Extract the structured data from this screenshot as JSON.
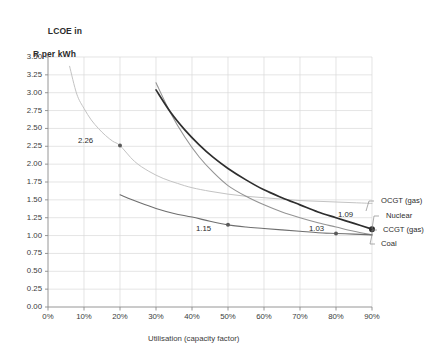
{
  "chart_data": {
    "type": "line",
    "title": "LCOE in R per kWh",
    "title_line1": "LCOE in",
    "title_line2": "R per kWh",
    "xlabel": "Utilisation (capacity factor)",
    "ylabel": "LCOE in R per kWh",
    "xlim": [
      0,
      90
    ],
    "ylim": [
      0,
      3.5
    ],
    "grid": true,
    "legend_position": "right-inline",
    "x_ticks": [
      "0%",
      "10%",
      "20%",
      "30%",
      "40%",
      "50%",
      "60%",
      "70%",
      "80%",
      "90%"
    ],
    "x_tick_values": [
      0,
      10,
      20,
      30,
      40,
      50,
      60,
      70,
      80,
      90
    ],
    "y_ticks": [
      "0.00",
      "0.25",
      "0.50",
      "0.75",
      "1.00",
      "1.25",
      "1.50",
      "1.75",
      "2.00",
      "2.25",
      "2.50",
      "2.75",
      "3.00",
      "3.25",
      "3.50"
    ],
    "y_tick_values": [
      0.0,
      0.25,
      0.5,
      0.75,
      1.0,
      1.25,
      1.5,
      1.75,
      2.0,
      2.25,
      2.5,
      2.75,
      3.0,
      3.25,
      3.5
    ],
    "series": [
      {
        "name": "OCGT (gas)",
        "color": "#c3c3c3",
        "x": [
          6,
          8,
          10,
          12,
          14,
          16,
          18,
          20,
          24,
          28,
          32,
          36,
          40,
          45,
          50,
          55,
          60,
          65,
          70,
          75,
          80,
          85,
          90
        ],
        "values": [
          3.37,
          2.98,
          2.78,
          2.62,
          2.5,
          2.4,
          2.32,
          2.26,
          2.04,
          1.9,
          1.8,
          1.73,
          1.67,
          1.62,
          1.58,
          1.55,
          1.53,
          1.51,
          1.49,
          1.48,
          1.47,
          1.46,
          1.45
        ]
      },
      {
        "name": "CCGT (gas)",
        "color": "#949494",
        "x": [
          30,
          34,
          38,
          42,
          46,
          50,
          55,
          60,
          65,
          70,
          75,
          80,
          85,
          90
        ],
        "values": [
          3.14,
          2.72,
          2.38,
          2.1,
          1.88,
          1.7,
          1.55,
          1.43,
          1.33,
          1.25,
          1.18,
          1.12,
          1.06,
          1.01
        ]
      },
      {
        "name": "Nuclear",
        "color": "#2e2e2e",
        "x": [
          30,
          34,
          38,
          42,
          46,
          50,
          55,
          60,
          65,
          70,
          75,
          80,
          85,
          90
        ],
        "values": [
          3.04,
          2.73,
          2.48,
          2.27,
          2.09,
          1.94,
          1.78,
          1.64,
          1.53,
          1.43,
          1.33,
          1.25,
          1.17,
          1.09
        ]
      },
      {
        "name": "Coal",
        "color": "#6e6e6e",
        "x": [
          20,
          25,
          30,
          35,
          40,
          45,
          50,
          55,
          60,
          65,
          70,
          75,
          80,
          85,
          90
        ],
        "values": [
          1.57,
          1.47,
          1.38,
          1.31,
          1.26,
          1.2,
          1.15,
          1.12,
          1.1,
          1.08,
          1.06,
          1.04,
          1.03,
          1.02,
          1.01
        ]
      }
    ],
    "annotations": [
      {
        "label": "2.26",
        "x": 20,
        "y": 2.26,
        "series": "OCGT (gas)"
      },
      {
        "label": "1.15",
        "x": 50,
        "y": 1.15,
        "series": "Coal"
      },
      {
        "label": "1.03",
        "x": 80,
        "y": 1.03,
        "series": "Coal"
      },
      {
        "label": "1.09",
        "x": 90,
        "y": 1.09,
        "series": "Nuclear"
      }
    ],
    "legend_entries": [
      "OCGT (gas)",
      "Nuclear",
      "CCGT (gas)",
      "Coal"
    ]
  }
}
